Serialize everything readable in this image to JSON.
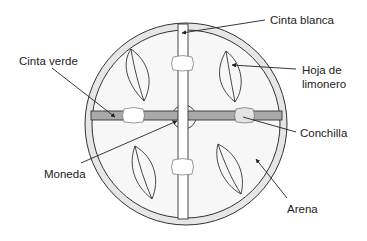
{
  "diagram": {
    "type": "labeled-schematic",
    "colors": {
      "background": "#ffffff",
      "rim": "#e6e6e6",
      "arena_fill": "#f7f7f7",
      "white_tape": "#ffffff",
      "green_tape": "#a9a9a9",
      "shell": "#ffffff",
      "shell_shaded": "#e3e3e3",
      "stroke": "#333333",
      "text": "#222222"
    },
    "labels": {
      "white_tape": "Cinta blanca",
      "green_tape": "Cinta verde",
      "leaf_line1": "Hoja de",
      "leaf_line2": "limonero",
      "shell": "Conchilla",
      "coin": "Moneda",
      "sand": "Arena"
    }
  }
}
